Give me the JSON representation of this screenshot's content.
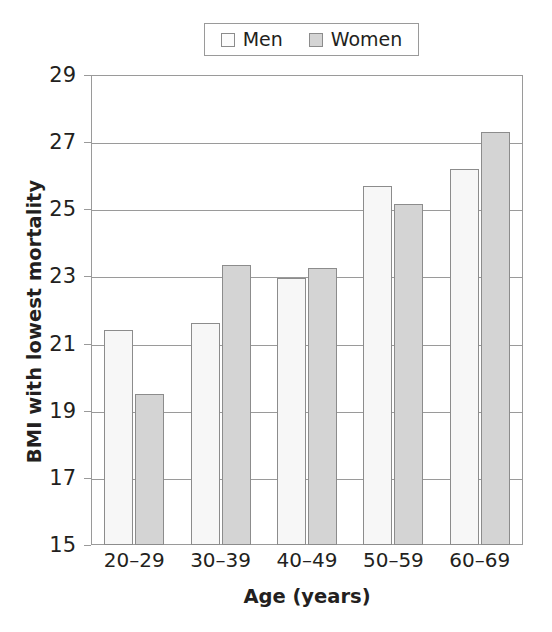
{
  "chart_data": {
    "type": "bar",
    "title": "",
    "xlabel": "Age (years)",
    "ylabel": "BMI with lowest mortality",
    "categories": [
      "20–29",
      "30–39",
      "40–49",
      "50–59",
      "60–69"
    ],
    "series": [
      {
        "name": "Men",
        "color": "#f7f7f7",
        "values": [
          21.4,
          21.6,
          22.95,
          25.7,
          26.2
        ]
      },
      {
        "name": "Women",
        "color": "#d4d4d4",
        "values": [
          19.5,
          23.35,
          23.25,
          25.15,
          27.3
        ]
      }
    ],
    "ylim": [
      15,
      29
    ],
    "yticks": [
      15,
      17,
      19,
      21,
      23,
      25,
      27,
      29
    ],
    "ytick_labels": [
      "15",
      "17",
      "19",
      "21",
      "23",
      "25",
      "27",
      "29"
    ],
    "grid": "horizontal",
    "legend_position": "top-center",
    "legend_entries": [
      "Men",
      "Women"
    ],
    "axis_color": "#9a9a9a",
    "bar_edge_color": "#8c8c8c",
    "text_color": "#231f20"
  }
}
